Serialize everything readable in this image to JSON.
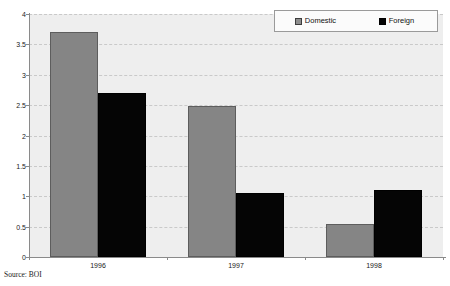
{
  "chart_data": {
    "type": "bar",
    "title": "",
    "subtitle": "",
    "xlabel": "",
    "ylabel": "",
    "categories": [
      "1996",
      "1997",
      "1998"
    ],
    "series": [
      {
        "name": "Domestic",
        "color": "#858585",
        "values": [
          3.7,
          2.48,
          0.55
        ]
      },
      {
        "name": "Foreign",
        "color": "#050505",
        "values": [
          2.7,
          1.05,
          1.1
        ]
      }
    ],
    "ylim": [
      0,
      4
    ],
    "yticks": [
      "0",
      "0.5",
      "1",
      "1.5",
      "2",
      "2.5",
      "3",
      "3.5",
      "4"
    ],
    "ytick_values": [
      0,
      0.5,
      1,
      1.5,
      2,
      2.5,
      3,
      3.5,
      4
    ],
    "grid": true,
    "legend_position": "top-right",
    "plot_background": "#eeeeee"
  },
  "legend": {
    "entries": [
      {
        "label": "Domestic",
        "swatch": "domestic-swatch"
      },
      {
        "label": "Foreign",
        "swatch": "foreign-swatch"
      }
    ]
  },
  "footer": {
    "source": "Source: BOI"
  }
}
